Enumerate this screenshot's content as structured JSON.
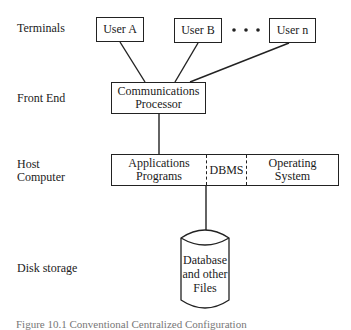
{
  "diagram": {
    "tiers": [
      {
        "label": "Terminals"
      },
      {
        "label": "Front End"
      },
      {
        "label": "Host\nComputer"
      },
      {
        "label": "Disk storage"
      }
    ],
    "terminals": {
      "users": [
        {
          "label": "User A"
        },
        {
          "label": "User B"
        },
        {
          "label": "User n"
        }
      ],
      "ellipsis": "• • •"
    },
    "front_end": {
      "label_line1": "Communications",
      "label_line2": "Processor"
    },
    "host": {
      "segments": [
        {
          "line1": "Applications",
          "line2": "Programs"
        },
        {
          "line1": "DBMS",
          "line2": ""
        },
        {
          "line1": "Operating",
          "line2": "System"
        }
      ]
    },
    "storage": {
      "line1": "Database",
      "line2": "and other",
      "line3": "Files"
    },
    "caption": "Figure 10.1  Conventional Centralized Configuration"
  }
}
